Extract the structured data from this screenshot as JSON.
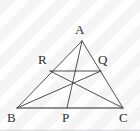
{
  "figure": {
    "kind": "geometry-diagram",
    "stroke_color": "#3b3b40",
    "base_stroke_color": "#6e6e73",
    "label_color": "#2e2e33",
    "background_color": "#ffffff",
    "width": 140,
    "height": 131,
    "points": {
      "A": {
        "label": "A",
        "x": 82,
        "y": 41,
        "label_x": 75,
        "label_y": 23
      },
      "B": {
        "label": "B",
        "x": 17,
        "y": 108,
        "label_x": 7,
        "label_y": 111
      },
      "C": {
        "label": "C",
        "x": 123,
        "y": 108,
        "label_x": 119,
        "label_y": 111
      },
      "P": {
        "label": "P",
        "x": 67,
        "y": 108,
        "label_x": 62,
        "label_y": 111
      },
      "Q": {
        "label": "Q",
        "x": 101,
        "y": 71,
        "label_x": 98,
        "label_y": 53
      },
      "R": {
        "label": "R",
        "x": 50,
        "y": 71,
        "label_x": 38,
        "label_y": 53
      },
      "G": {
        "label": "",
        "x": 70,
        "y": 80,
        "label_x": 0,
        "label_y": 0
      }
    },
    "segments": [
      {
        "name": "side-AB",
        "from": "A",
        "to": "B",
        "weight": 0.9
      },
      {
        "name": "side-AC",
        "from": "A",
        "to": "C",
        "weight": 0.9
      },
      {
        "name": "side-BC",
        "from": "B",
        "to": "C",
        "weight": 1.3
      },
      {
        "name": "cevian-AP",
        "from": "A",
        "to": "P",
        "weight": 0.9
      },
      {
        "name": "cevian-BQ",
        "from": "B",
        "to": "Q",
        "weight": 0.9
      },
      {
        "name": "cevian-CR",
        "from": "C",
        "to": "R",
        "weight": 0.9
      },
      {
        "name": "segment-RQ",
        "from": "R",
        "to": "Q",
        "weight": 0.9
      }
    ],
    "labels_order": [
      "A",
      "R",
      "Q",
      "B",
      "P",
      "C"
    ]
  }
}
